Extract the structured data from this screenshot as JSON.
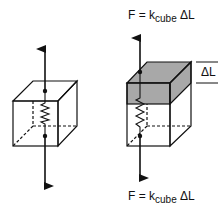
{
  "diagram": {
    "left_panel": {
      "description": "Unstressed cube containing a spring, opposing forces applied",
      "state": "relaxed"
    },
    "right_panel": {
      "description": "Cube stretched by deltaL under force",
      "state": "stretched",
      "top_force_label": {
        "lhs": "F = k",
        "subscript": "cube",
        "rhs": " ΔL"
      },
      "bottom_force_label": {
        "lhs": "F = k",
        "subscript": "cube",
        "rhs": " ΔL"
      },
      "extension_label": "ΔL"
    },
    "colors": {
      "line": "#111111",
      "shaded_region": "#a8a8a8",
      "background": "#ffffff"
    }
  }
}
